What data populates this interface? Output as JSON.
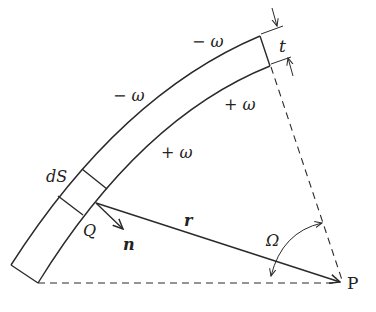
{
  "diagram": {
    "labels": {
      "outer_top": "− ω",
      "outer_mid": "− ω",
      "inner_top": "+ ω",
      "inner_mid": "+ ω",
      "thickness": "t",
      "element": "dS",
      "point_on_surface": "Q",
      "normal": "n",
      "distance": "r",
      "solid_angle": "Ω",
      "field_point": "P"
    }
  }
}
